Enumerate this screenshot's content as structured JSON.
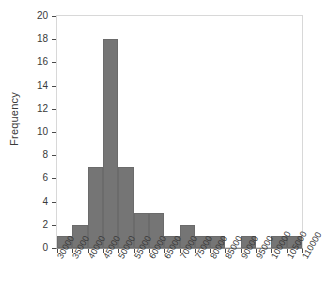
{
  "chart_data": {
    "type": "bar",
    "title": "",
    "subtitle": "",
    "xlabel": "",
    "ylabel": "Frequency",
    "grid": false,
    "legend": null,
    "legend_position": "none",
    "bin_width": 5000,
    "bin_edges": [
      30000,
      35000,
      40000,
      45000,
      50000,
      55000,
      60000,
      65000,
      70000,
      75000,
      80000,
      85000,
      90000,
      95000,
      100000,
      105000,
      110000
    ],
    "categories": [
      "30000-35000",
      "35000-40000",
      "40000-45000",
      "45000-50000",
      "50000-55000",
      "55000-60000",
      "60000-65000",
      "65000-70000",
      "70000-75000",
      "75000-80000",
      "80000-85000",
      "85000-90000",
      "90000-95000",
      "95000-100000",
      "100000-105000",
      "105000-110000"
    ],
    "values": [
      1,
      2,
      7,
      18,
      7,
      3,
      3,
      1,
      2,
      1,
      1,
      0,
      1,
      0,
      1,
      1
    ],
    "x": [
      30000,
      35000,
      40000,
      45000,
      50000,
      55000,
      60000,
      65000,
      70000,
      75000,
      80000,
      85000,
      90000,
      95000,
      100000,
      105000,
      110000
    ],
    "xlim": [
      30000,
      110000
    ],
    "ylim": [
      0,
      20
    ],
    "ytick_labels": [
      "0",
      "2",
      "4",
      "6",
      "8",
      "10",
      "12",
      "14",
      "16",
      "18",
      "20"
    ],
    "ytick_values": [
      0,
      2,
      4,
      6,
      8,
      10,
      12,
      14,
      16,
      18,
      20
    ],
    "xtick_labels": [
      "30000",
      "35000",
      "40000",
      "45000",
      "50000",
      "55000",
      "60000",
      "65000",
      "70000",
      "75000",
      "80000",
      "85000",
      "90000",
      "95000",
      "100000",
      "105000",
      "110000"
    ],
    "xtick_values": [
      30000,
      35000,
      40000,
      45000,
      50000,
      55000,
      60000,
      65000,
      70000,
      75000,
      80000,
      85000,
      90000,
      95000,
      100000,
      105000,
      110000
    ],
    "bar_color": "#757575",
    "bar_edge_color": "#6b6b6b",
    "axis_color": "#8a8a8a",
    "frame_color": "#d8d8d8",
    "text_color": "#3a3a3a",
    "background": "#ffffff"
  }
}
